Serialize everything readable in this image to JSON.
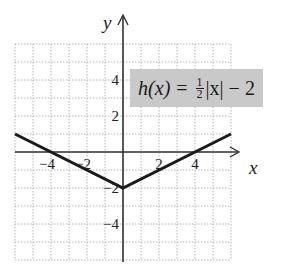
{
  "chart_data": {
    "type": "line",
    "title": "",
    "function_label": {
      "name": "h(x)",
      "equals": "=",
      "frac_num": "1",
      "frac_den": "2",
      "rest": "|x| − 2"
    },
    "xlabel": "x",
    "ylabel": "y",
    "xlim": [
      -6,
      6
    ],
    "ylim": [
      -6,
      6
    ],
    "x_ticks": [
      {
        "v": -4,
        "t": "−4"
      },
      {
        "v": -2,
        "t": "−2"
      },
      {
        "v": 2,
        "t": "2"
      },
      {
        "v": 4,
        "t": "4"
      }
    ],
    "y_ticks": [
      {
        "v": 4,
        "t": "4"
      },
      {
        "v": 2,
        "t": "2"
      },
      {
        "v": -2,
        "t": "−2"
      },
      {
        "v": -4,
        "t": "−4"
      }
    ],
    "grid": true,
    "series": [
      {
        "name": "h(x) = 1/2|x| - 2",
        "x": [
          -6,
          0,
          6
        ],
        "y": [
          1,
          -2,
          1
        ]
      }
    ]
  }
}
